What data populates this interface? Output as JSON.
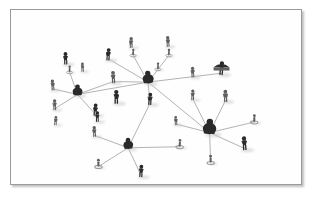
{
  "image": {
    "kind": "photograph-of-model-figurines",
    "subject": "social-network-diagram",
    "title": "Social network of miniature human figurines connected by lines",
    "background_color": "#ffffff",
    "frame": {
      "border_color": "#9a9a9a",
      "border_width_px": 1,
      "shadow_color": "#5a5a5a",
      "left": 10,
      "top": 9,
      "width": 292,
      "height": 176
    },
    "line_color": "#8e8e8e",
    "figure_color_dark": "#2b2b2b",
    "figure_color_mid": "#5e5e5e",
    "figure_color_light": "#9d9d9d",
    "shadow_color": "#c9c9c9"
  },
  "chart_data": {
    "type": "scatter",
    "xlabel": "",
    "ylabel": "",
    "xlim": [
      0,
      292
    ],
    "ylim": [
      0,
      176
    ],
    "grid": false,
    "legend": "none",
    "node_count": 33,
    "edge_count": 24,
    "hub_count": 4,
    "nodes": [
      {
        "id": "n1",
        "x": 138,
        "y": 68,
        "size": 9,
        "tone": "dark",
        "role": "hub",
        "label": "center-hub"
      },
      {
        "id": "n2",
        "x": 67,
        "y": 81,
        "size": 8,
        "tone": "dark",
        "role": "hub",
        "label": "left-hub"
      },
      {
        "id": "n3",
        "x": 200,
        "y": 118,
        "size": 11,
        "tone": "dark",
        "role": "hub",
        "label": "right-hub"
      },
      {
        "id": "n4",
        "x": 118,
        "y": 135,
        "size": 8,
        "tone": "dark",
        "role": "hub",
        "label": "bottom-hub"
      },
      {
        "id": "n5",
        "x": 121,
        "y": 33,
        "size": 7,
        "tone": "mid",
        "role": "leaf",
        "label": "standing-figure-top"
      },
      {
        "id": "n6",
        "x": 123,
        "y": 43,
        "size": 5,
        "tone": "light",
        "role": "leaf",
        "label": "ring-base-top"
      },
      {
        "id": "n7",
        "x": 158,
        "y": 32,
        "size": 7,
        "tone": "mid",
        "role": "leaf",
        "label": "standing-figure-top-right"
      },
      {
        "id": "n8",
        "x": 159,
        "y": 43,
        "size": 5,
        "tone": "light",
        "role": "leaf",
        "label": "ring-base-top-right"
      },
      {
        "id": "n9",
        "x": 98,
        "y": 45,
        "size": 8,
        "tone": "dark",
        "role": "leaf",
        "label": "walking-figure"
      },
      {
        "id": "n10",
        "x": 55,
        "y": 49,
        "size": 8,
        "tone": "dark",
        "role": "leaf",
        "label": "dark-figure-upper-left"
      },
      {
        "id": "n11",
        "x": 59,
        "y": 60,
        "size": 5,
        "tone": "light",
        "role": "leaf",
        "label": "ring-base-upper-left"
      },
      {
        "id": "n12",
        "x": 42,
        "y": 76,
        "size": 7,
        "tone": "mid",
        "role": "leaf",
        "label": "figure-left-edge"
      },
      {
        "id": "n13",
        "x": 44,
        "y": 96,
        "size": 7,
        "tone": "mid",
        "role": "leaf",
        "label": "crouching-figure-left"
      },
      {
        "id": "n14",
        "x": 85,
        "y": 101,
        "size": 8,
        "tone": "dark",
        "role": "leaf",
        "label": "figure-with-bag"
      },
      {
        "id": "n15",
        "x": 103,
        "y": 68,
        "size": 8,
        "tone": "mid",
        "role": "leaf",
        "label": "figure-mid-left"
      },
      {
        "id": "n16",
        "x": 106,
        "y": 88,
        "size": 9,
        "tone": "dark",
        "role": "leaf",
        "label": "seated-figure"
      },
      {
        "id": "n17",
        "x": 140,
        "y": 90,
        "size": 8,
        "tone": "dark",
        "role": "leaf",
        "label": "figure-below-center"
      },
      {
        "id": "n18",
        "x": 183,
        "y": 63,
        "size": 7,
        "tone": "mid",
        "role": "leaf",
        "label": "small-figure-right"
      },
      {
        "id": "n19",
        "x": 183,
        "y": 86,
        "size": 7,
        "tone": "mid",
        "role": "leaf",
        "label": "figure-right-upper"
      },
      {
        "id": "n20",
        "x": 212,
        "y": 59,
        "size": 9,
        "tone": "dark",
        "role": "leaf",
        "label": "figure-with-canopy"
      },
      {
        "id": "n21",
        "x": 216,
        "y": 87,
        "size": 8,
        "tone": "mid",
        "role": "leaf",
        "label": "figure-arms-up"
      },
      {
        "id": "n22",
        "x": 245,
        "y": 110,
        "size": 6,
        "tone": "light",
        "role": "leaf",
        "label": "ring-figure-far-right"
      },
      {
        "id": "n23",
        "x": 235,
        "y": 135,
        "size": 9,
        "tone": "dark",
        "role": "leaf",
        "label": "bent-figure-lower-right"
      },
      {
        "id": "n24",
        "x": 201,
        "y": 151,
        "size": 6,
        "tone": "light",
        "role": "leaf",
        "label": "ring-figure-bottom-right"
      },
      {
        "id": "n25",
        "x": 170,
        "y": 135,
        "size": 6,
        "tone": "light",
        "role": "leaf",
        "label": "ring-figure-bottom-center"
      },
      {
        "id": "n26",
        "x": 166,
        "y": 112,
        "size": 6,
        "tone": "mid",
        "role": "leaf",
        "label": "figure-left-of-right-hub"
      },
      {
        "id": "n27",
        "x": 88,
        "y": 155,
        "size": 6,
        "tone": "light",
        "role": "leaf",
        "label": "ring-figure-lower-left"
      },
      {
        "id": "n28",
        "x": 131,
        "y": 163,
        "size": 8,
        "tone": "dark",
        "role": "leaf",
        "label": "figure-bottom"
      },
      {
        "id": "n29",
        "x": 84,
        "y": 123,
        "size": 7,
        "tone": "mid",
        "role": "leaf",
        "label": "running-figure"
      },
      {
        "id": "n30",
        "x": 87,
        "y": 108,
        "size": 7,
        "tone": "dark",
        "role": "isolated",
        "label": "isolated-figure-left"
      },
      {
        "id": "n31",
        "x": 45,
        "y": 112,
        "size": 6,
        "tone": "mid",
        "role": "isolated",
        "label": "isolated-figure-lower-left"
      },
      {
        "id": "n32",
        "x": 72,
        "y": 58,
        "size": 6,
        "tone": "mid",
        "role": "isolated",
        "label": "isolated-figure-upper"
      },
      {
        "id": "n33",
        "x": 148,
        "y": 57,
        "size": 5,
        "tone": "light",
        "role": "isolated",
        "label": "small-figure-near-center"
      }
    ],
    "edges": [
      {
        "from": "n1",
        "to": "n6"
      },
      {
        "from": "n1",
        "to": "n8"
      },
      {
        "from": "n1",
        "to": "n9"
      },
      {
        "from": "n1",
        "to": "n15"
      },
      {
        "from": "n1",
        "to": "n17"
      },
      {
        "from": "n1",
        "to": "n20"
      },
      {
        "from": "n1",
        "to": "n2"
      },
      {
        "from": "n1",
        "to": "n3"
      },
      {
        "from": "n2",
        "to": "n11"
      },
      {
        "from": "n2",
        "to": "n12"
      },
      {
        "from": "n2",
        "to": "n13"
      },
      {
        "from": "n2",
        "to": "n14"
      },
      {
        "from": "n2",
        "to": "n15"
      },
      {
        "from": "n3",
        "to": "n19"
      },
      {
        "from": "n3",
        "to": "n21"
      },
      {
        "from": "n3",
        "to": "n22"
      },
      {
        "from": "n3",
        "to": "n23"
      },
      {
        "from": "n3",
        "to": "n24"
      },
      {
        "from": "n3",
        "to": "n26"
      },
      {
        "from": "n4",
        "to": "n17"
      },
      {
        "from": "n4",
        "to": "n25"
      },
      {
        "from": "n4",
        "to": "n27"
      },
      {
        "from": "n4",
        "to": "n28"
      },
      {
        "from": "n4",
        "to": "n29"
      }
    ]
  }
}
